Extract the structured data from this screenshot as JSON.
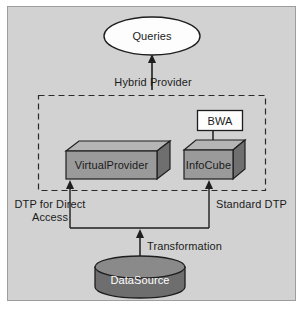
{
  "diagram": {
    "title_nodes": {
      "queries": "Queries",
      "bwa": "BWA",
      "virtual_provider": "VirtualProvider",
      "infocube": "InfoCube",
      "datasource": "DataSource"
    },
    "edge_labels": {
      "hybrid_provider": "Hybrid Provider",
      "dtp_direct_access": "DTP for Direct Access",
      "standard_dtp": "Standard DTP",
      "transformation": "Transformation"
    },
    "colors": {
      "background": "#d2d2d2",
      "panel_border": "#9d9d9d",
      "node_face": "#9a9a9a",
      "node_top": "#b5b5b5",
      "node_side": "#6f6f6f",
      "white_node": "#fdfdfd",
      "datasource_fill": "#6e6e6e",
      "datasource_top": "#8a8a8a",
      "stroke": "#2a2a2a",
      "text": "#1b1b1b",
      "text_light": "#ffffff"
    }
  }
}
